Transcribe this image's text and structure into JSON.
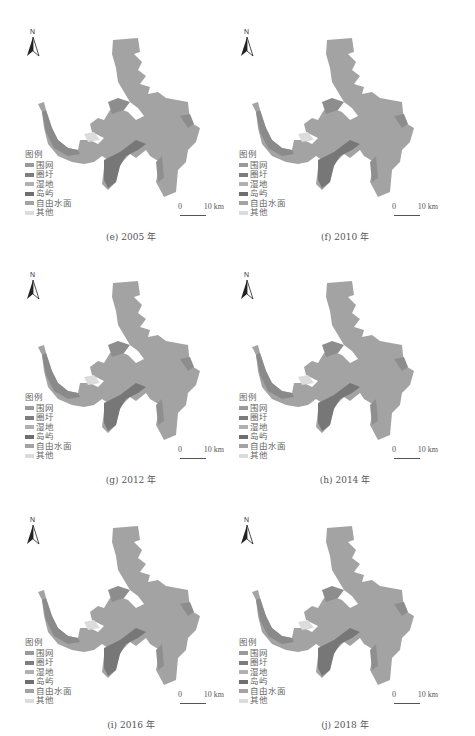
{
  "figure": {
    "legend": {
      "title": "图例",
      "items": [
        {
          "label": "围网",
          "color": "#9a9a9a"
        },
        {
          "label": "圈圩",
          "color": "#7d7d7d"
        },
        {
          "label": "湿地",
          "color": "#b0b0b0"
        },
        {
          "label": "岛屿",
          "color": "#6e6e6e"
        },
        {
          "label": "自由水面",
          "color": "#a3a3a3"
        },
        {
          "label": "其他",
          "color": "#dcdcdc"
        }
      ]
    },
    "north_label": "N",
    "scale": {
      "zero": "0",
      "distance": "10 km"
    },
    "panels": [
      {
        "caption": "(e) 2005 年",
        "year": "2005"
      },
      {
        "caption": "(f) 2010 年",
        "year": "2010"
      },
      {
        "caption": "(g) 2012 年",
        "year": "2012"
      },
      {
        "caption": "(h) 2014 年",
        "year": "2014"
      },
      {
        "caption": "(i) 2016 年",
        "year": "2016"
      },
      {
        "caption": "(j) 2018 年",
        "year": "2018"
      }
    ]
  }
}
